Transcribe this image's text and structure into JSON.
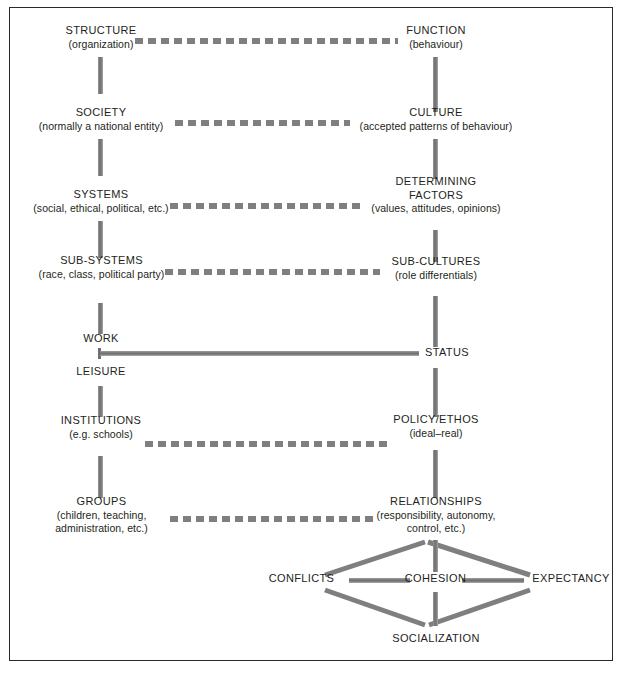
{
  "diagram": {
    "colors": {
      "connector": "#7f7f7f",
      "text": "#231f20",
      "border": "#2b2b2b",
      "background": "#ffffff"
    },
    "left_column": [
      {
        "title": "STRUCTURE",
        "sub": "(organization)"
      },
      {
        "title": "SOCIETY",
        "sub": "(normally a national entity)"
      },
      {
        "title": "SYSTEMS",
        "sub": "(social, ethical, political, etc.)"
      },
      {
        "title": "SUB-SYSTEMS",
        "sub": "(race, class, political party)"
      },
      {
        "title": "WORK",
        "sub": ""
      },
      {
        "title": "LEISURE",
        "sub": ""
      },
      {
        "title": "INSTITUTIONS",
        "sub": "(e.g. schools)"
      },
      {
        "title": "GROUPS",
        "sub": "(children, teaching,\nadministration, etc.)"
      }
    ],
    "right_column": [
      {
        "title": "FUNCTION",
        "sub": "(behaviour)"
      },
      {
        "title": "CULTURE",
        "sub": "(accepted patterns of behaviour)"
      },
      {
        "title": "DETERMINING\nFACTORS",
        "sub": "(values, attitudes, opinions)"
      },
      {
        "title": "SUB-CULTURES",
        "sub": "(role differentials)"
      },
      {
        "title": "STATUS",
        "sub": ""
      },
      {
        "title": "POLICY/ETHOS",
        "sub": "(ideal–real)"
      },
      {
        "title": "RELATIONSHIPS",
        "sub": "(responsibility, autonomy,\ncontrol, etc.)"
      }
    ],
    "bottom_cluster": [
      {
        "title": "CONFLICTS",
        "sub": ""
      },
      {
        "title": "COHESION",
        "sub": ""
      },
      {
        "title": "EXPECTANCY",
        "sub": ""
      },
      {
        "title": "SOCIALIZATION",
        "sub": ""
      }
    ],
    "labels": {
      "structure_title": "STRUCTURE",
      "structure_sub": "(organization)",
      "society_title": "SOCIETY",
      "society_sub": "(normally a national entity)",
      "systems_title": "SYSTEMS",
      "systems_sub": "(social, ethical, political, etc.)",
      "subsystems_title": "SUB-SYSTEMS",
      "subsystems_sub": "(race, class, political party)",
      "work_title": "WORK",
      "leisure_title": "LEISURE",
      "institutions_title": "INSTITUTIONS",
      "institutions_sub": "(e.g. schools)",
      "groups_title": "GROUPS",
      "groups_sub_line1": "(children, teaching,",
      "groups_sub_line2": "administration, etc.)",
      "function_title": "FUNCTION",
      "function_sub": "(behaviour)",
      "culture_title": "CULTURE",
      "culture_sub": "(accepted patterns of behaviour)",
      "determining_title_line1": "DETERMINING",
      "determining_title_line2": "FACTORS",
      "determining_sub": "(values, attitudes, opinions)",
      "subcultures_title": "SUB-CULTURES",
      "subcultures_sub": "(role differentials)",
      "status_title": "STATUS",
      "policy_title": "POLICY/ETHOS",
      "policy_sub": "(ideal–real)",
      "relationships_title": "RELATIONSHIPS",
      "relationships_sub_line1": "(responsibility, autonomy,",
      "relationships_sub_line2": "control, etc.)",
      "conflicts_title": "CONFLICTS",
      "cohesion_title": "COHESION",
      "expectancy_title": "EXPECTANCY",
      "socialization_title": "SOCIALIZATION"
    }
  }
}
